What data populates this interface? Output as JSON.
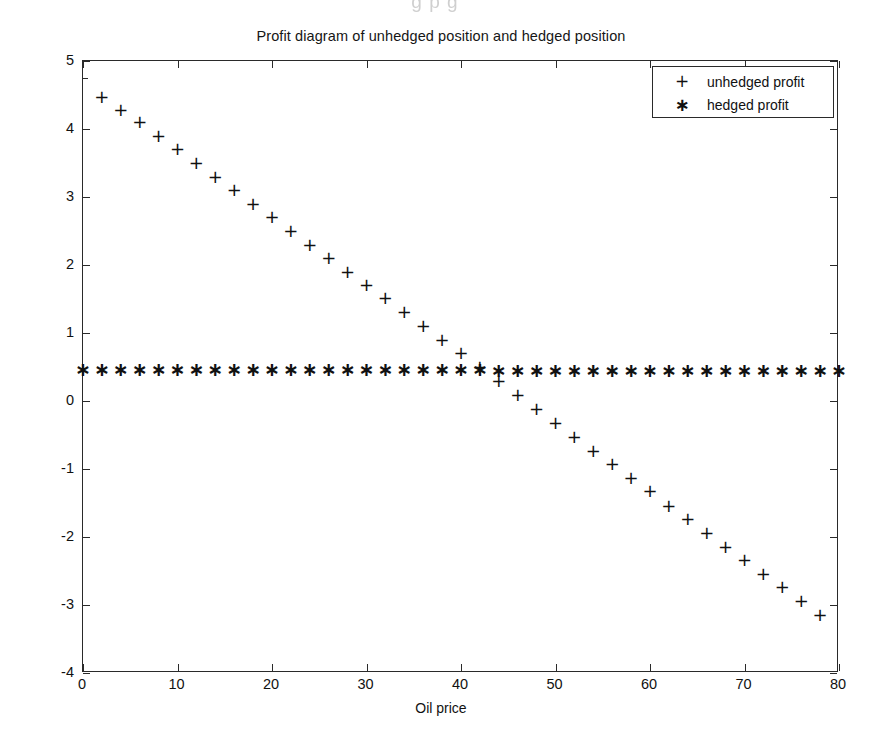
{
  "figure": {
    "title": "Profit diagram of unhedged position and hedged position",
    "scan_artifact_text": "g p    g"
  },
  "axes": {
    "xlabel": "Oil price",
    "ylabel": "Profit",
    "xticklabels": [
      "0",
      "10",
      "20",
      "30",
      "40",
      "50",
      "60",
      "70",
      "80"
    ],
    "yticklabels": [
      "-4",
      "-3",
      "-2",
      "-1",
      "0",
      "1",
      "2",
      "3",
      "4",
      "5"
    ]
  },
  "legend": {
    "items": [
      {
        "marker": "+",
        "label": "unhedged profit",
        "marker_name": "plus-marker"
      },
      {
        "marker": "*",
        "label": "hedged profit",
        "marker_name": "asterisk-marker"
      }
    ]
  },
  "chart_data": {
    "type": "scatter",
    "title": "Profit diagram of unhedged position and hedged position",
    "xlabel": "Oil price",
    "ylabel": "Profit",
    "xlim": [
      0,
      80
    ],
    "ylim": [
      -4,
      5
    ],
    "xticks": [
      0,
      10,
      20,
      30,
      40,
      50,
      60,
      70,
      80
    ],
    "yticks": [
      -4,
      -3,
      -2,
      -1,
      0,
      1,
      2,
      3,
      4,
      5
    ],
    "grid": false,
    "legend_position": "upper right",
    "x": [
      2,
      4,
      6,
      8,
      10,
      12,
      14,
      16,
      18,
      20,
      22,
      24,
      26,
      28,
      30,
      32,
      34,
      36,
      38,
      40,
      42,
      44,
      46,
      48,
      50,
      52,
      54,
      56,
      58,
      60,
      62,
      64,
      66,
      68,
      70,
      72,
      74,
      76,
      78
    ],
    "series": [
      {
        "name": "unhedged profit",
        "marker": "+",
        "color": "#111111",
        "values": [
          4.47,
          4.28,
          4.1,
          3.9,
          3.7,
          3.5,
          3.3,
          3.1,
          2.9,
          2.7,
          2.5,
          2.3,
          2.1,
          1.9,
          1.7,
          1.51,
          1.31,
          1.1,
          0.9,
          0.7,
          0.5,
          0.3,
          0.09,
          -0.12,
          -0.33,
          -0.53,
          -0.73,
          -0.93,
          -1.13,
          -1.33,
          -1.54,
          -1.74,
          -1.94,
          -2.14,
          -2.34,
          -2.54,
          -2.74,
          -2.94,
          -3.15
        ]
      },
      {
        "name": "hedged profit",
        "marker": "*",
        "color": "#111111",
        "x": [
          0,
          2,
          4,
          6,
          8,
          10,
          12,
          14,
          16,
          18,
          20,
          22,
          24,
          26,
          28,
          30,
          32,
          34,
          36,
          38,
          40,
          42,
          44,
          46,
          48,
          50,
          52,
          54,
          56,
          58,
          60,
          62,
          64,
          66,
          68,
          70,
          72,
          74,
          76,
          78,
          80
        ],
        "values": [
          0.47,
          0.47,
          0.47,
          0.47,
          0.47,
          0.47,
          0.47,
          0.47,
          0.47,
          0.47,
          0.47,
          0.47,
          0.47,
          0.47,
          0.47,
          0.47,
          0.47,
          0.47,
          0.47,
          0.47,
          0.47,
          0.47,
          0.46,
          0.46,
          0.46,
          0.46,
          0.46,
          0.46,
          0.46,
          0.46,
          0.46,
          0.46,
          0.46,
          0.45,
          0.45,
          0.45,
          0.45,
          0.45,
          0.45,
          0.45,
          0.45
        ]
      }
    ]
  }
}
